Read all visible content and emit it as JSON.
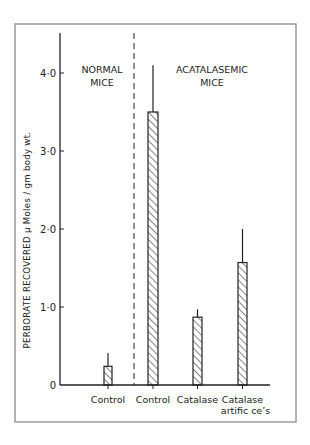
{
  "chart_data": {
    "type": "bar",
    "title": "",
    "xlabel": "",
    "ylabel": "PERBORATE  RECOVERED  μ Moles / gm body wt.",
    "ylim": [
      0,
      4.5
    ],
    "yticks": [
      0,
      1.0,
      2.0,
      3.0,
      4.0
    ],
    "ytick_labels": [
      "0",
      "1·0",
      "2·0",
      "3·0",
      "4·0"
    ],
    "grid": false,
    "legend": null,
    "groups": [
      {
        "label_lines": [
          "NORMAL",
          "MICE"
        ],
        "categories": [
          "Control"
        ]
      },
      {
        "label_lines": [
          "ACATALASEMIC",
          "MICE"
        ],
        "categories": [
          "Control",
          "Catalase",
          "Catalase artific cells"
        ]
      }
    ],
    "categories": [
      "Control (Normal)",
      "Control (Acatalasemic)",
      "Catalase",
      "Catalase artific cells"
    ],
    "category_labels": [
      [
        "Control"
      ],
      [
        "Control"
      ],
      [
        "Catalase"
      ],
      [
        "Catalase",
        "artific ce’s"
      ]
    ],
    "values": [
      0.24,
      3.5,
      0.87,
      1.57
    ],
    "error_upper": [
      0.41,
      4.1,
      0.97,
      2.0
    ],
    "bar_fill": "hatched",
    "separator": "dashed vertical line between normal and acatalasemic groups"
  },
  "colors": {
    "ink": "#222222",
    "frame": "#9a9a9a",
    "background": "#ffffff"
  }
}
